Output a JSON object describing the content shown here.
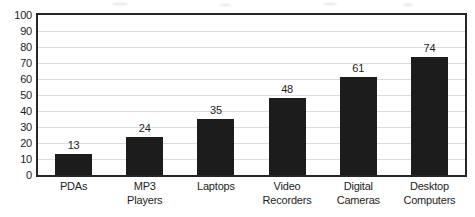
{
  "chart_data": {
    "type": "bar",
    "title": "",
    "xlabel": "",
    "ylabel": "",
    "categories": [
      "PDAs",
      "MP3 Players",
      "Laptops",
      "Video Recorders",
      "Digital Cameras",
      "Desktop Computers"
    ],
    "category_lines": [
      [
        "PDAs"
      ],
      [
        "MP3",
        "Players"
      ],
      [
        "Laptops"
      ],
      [
        "Video",
        "Recorders"
      ],
      [
        "Digital",
        "Cameras"
      ],
      [
        "Desktop",
        "Computers"
      ]
    ],
    "values": [
      13,
      24,
      35,
      48,
      61,
      74
    ],
    "data_labels": [
      "13",
      "24",
      "35",
      "48",
      "61",
      "74"
    ],
    "ylim": [
      0,
      100
    ],
    "ytick_step": 10,
    "yticks": [
      100,
      90,
      80,
      70,
      60,
      50,
      40,
      30,
      20,
      10,
      0
    ],
    "ytick_labels": [
      "100",
      "90",
      "80",
      "70",
      "60",
      "50",
      "40",
      "30",
      "20",
      "10",
      "0"
    ],
    "grid": {
      "horizontal": true,
      "vertical": false
    },
    "legend": {
      "visible": false,
      "position": "none"
    },
    "series": [
      {
        "name": "",
        "values": [
          13,
          24,
          35,
          48,
          61,
          74
        ]
      }
    ]
  },
  "style": {
    "bar_color": "#1c1c1c",
    "grid_color": "#dcdcdc",
    "axis_color": "#262626",
    "text_color": "#1d1d1d",
    "background_color": "#ffffff"
  }
}
